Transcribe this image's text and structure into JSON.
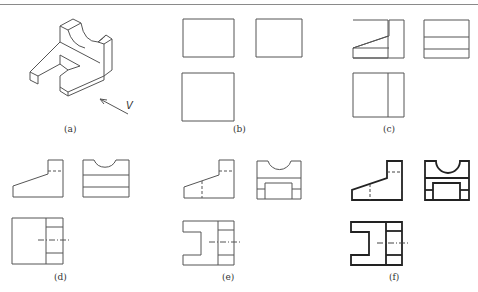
{
  "figure": {
    "panels": [
      {
        "id": "a",
        "label": "(a)",
        "content": "isometric view of part",
        "arrow_label": "V"
      },
      {
        "id": "b",
        "label": "(b)",
        "content": "bounding rectangles of front, side and top views"
      },
      {
        "id": "c",
        "label": "(c)",
        "content": "sloped base outline added"
      },
      {
        "id": "d",
        "label": "(d)",
        "content": "semicircular notch added, hidden lines"
      },
      {
        "id": "e",
        "label": "(e)",
        "content": "U-shaped cutout added"
      },
      {
        "id": "f",
        "label": "(f)",
        "content": "final thickened outlines"
      }
    ]
  },
  "colors": {
    "line": "#555555",
    "line_bold": "#222222",
    "rule": "#8a8a8a",
    "background": "#ffffff"
  }
}
